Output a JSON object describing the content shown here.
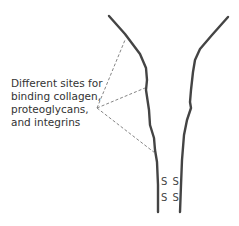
{
  "diagram": {
    "label_lines": [
      "Different sites for",
      "binding collagen,",
      "proteoglycans,",
      "and integrins"
    ],
    "disulfide_bonds": [
      "S S",
      "S S"
    ],
    "colors": {
      "chain_stroke": "#444444",
      "pointer_stroke": "#777777",
      "text": "#333333"
    }
  }
}
